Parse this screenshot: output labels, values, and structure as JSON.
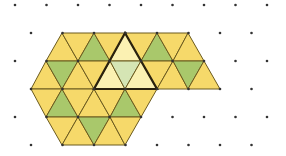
{
  "diagram": {
    "colors": {
      "yellow": "#F6D96A",
      "green": "#A9C86B",
      "pale_yellow": "#FBF1B2",
      "pale_green": "#D5E5B4",
      "edge": "#6B5A1E",
      "highlight_edge": "#2A220E",
      "dot": "#333333"
    },
    "grid": {
      "spacing_x": 31.5,
      "rows_y": [
        5,
        33,
        61,
        89,
        117,
        145
      ],
      "even_row_x0": 15,
      "odd_row_x0": 31,
      "even_row_count": 9,
      "odd_row_count": 8
    },
    "bands": [
      {
        "y_top": 33,
        "y_bottom": 61,
        "triangles": [
          {
            "pts": [
              [
                62,
                33
              ],
              [
                46,
                61
              ],
              [
                78,
                61
              ]
            ],
            "fill": "yellow"
          },
          {
            "pts": [
              [
                62,
                33
              ],
              [
                94,
                33
              ],
              [
                78,
                61
              ]
            ],
            "fill": "yellow"
          },
          {
            "pts": [
              [
                94,
                33
              ],
              [
                78,
                61
              ],
              [
                110,
                61
              ]
            ],
            "fill": "green"
          },
          {
            "pts": [
              [
                94,
                33
              ],
              [
                125,
                33
              ],
              [
                110,
                61
              ]
            ],
            "fill": "yellow"
          },
          {
            "pts": [
              [
                125,
                33
              ],
              [
                110,
                61
              ],
              [
                141,
                61
              ]
            ],
            "fill": "pale_yellow"
          },
          {
            "pts": [
              [
                125,
                33
              ],
              [
                157,
                33
              ],
              [
                141,
                61
              ]
            ],
            "fill": "yellow"
          },
          {
            "pts": [
              [
                157,
                33
              ],
              [
                141,
                61
              ],
              [
                173,
                61
              ]
            ],
            "fill": "green"
          },
          {
            "pts": [
              [
                157,
                33
              ],
              [
                188,
                33
              ],
              [
                173,
                61
              ]
            ],
            "fill": "yellow"
          },
          {
            "pts": [
              [
                188,
                33
              ],
              [
                173,
                61
              ],
              [
                204,
                61
              ]
            ],
            "fill": "yellow"
          }
        ]
      },
      {
        "y_top": 61,
        "y_bottom": 89,
        "triangles": [
          {
            "pts": [
              [
                46,
                61
              ],
              [
                31,
                89
              ],
              [
                62,
                89
              ]
            ],
            "fill": "yellow"
          },
          {
            "pts": [
              [
                46,
                61
              ],
              [
                78,
                61
              ],
              [
                62,
                89
              ]
            ],
            "fill": "green"
          },
          {
            "pts": [
              [
                78,
                61
              ],
              [
                62,
                89
              ],
              [
                94,
                89
              ]
            ],
            "fill": "yellow"
          },
          {
            "pts": [
              [
                78,
                61
              ],
              [
                110,
                61
              ],
              [
                94,
                89
              ]
            ],
            "fill": "yellow"
          },
          {
            "pts": [
              [
                110,
                61
              ],
              [
                94,
                89
              ],
              [
                125,
                89
              ]
            ],
            "fill": "pale_yellow"
          },
          {
            "pts": [
              [
                110,
                61
              ],
              [
                141,
                61
              ],
              [
                125,
                89
              ]
            ],
            "fill": "pale_green"
          },
          {
            "pts": [
              [
                141,
                61
              ],
              [
                125,
                89
              ],
              [
                157,
                89
              ]
            ],
            "fill": "pale_yellow"
          },
          {
            "pts": [
              [
                141,
                61
              ],
              [
                173,
                61
              ],
              [
                157,
                89
              ]
            ],
            "fill": "yellow"
          },
          {
            "pts": [
              [
                173,
                61
              ],
              [
                157,
                89
              ],
              [
                188,
                89
              ]
            ],
            "fill": "yellow"
          },
          {
            "pts": [
              [
                173,
                61
              ],
              [
                204,
                61
              ],
              [
                188,
                89
              ]
            ],
            "fill": "green"
          },
          {
            "pts": [
              [
                204,
                61
              ],
              [
                188,
                89
              ],
              [
                220,
                89
              ]
            ],
            "fill": "yellow"
          }
        ]
      },
      {
        "y_top": 89,
        "y_bottom": 117,
        "triangles": [
          {
            "pts": [
              [
                31,
                89
              ],
              [
                62,
                89
              ],
              [
                46,
                117
              ]
            ],
            "fill": "yellow"
          },
          {
            "pts": [
              [
                62,
                89
              ],
              [
                46,
                117
              ],
              [
                78,
                117
              ]
            ],
            "fill": "green"
          },
          {
            "pts": [
              [
                62,
                89
              ],
              [
                94,
                89
              ],
              [
                78,
                117
              ]
            ],
            "fill": "yellow"
          },
          {
            "pts": [
              [
                94,
                89
              ],
              [
                78,
                117
              ],
              [
                110,
                117
              ]
            ],
            "fill": "yellow"
          },
          {
            "pts": [
              [
                94,
                89
              ],
              [
                125,
                89
              ],
              [
                110,
                117
              ]
            ],
            "fill": "yellow"
          },
          {
            "pts": [
              [
                125,
                89
              ],
              [
                110,
                117
              ],
              [
                141,
                117
              ]
            ],
            "fill": "green"
          },
          {
            "pts": [
              [
                125,
                89
              ],
              [
                157,
                89
              ],
              [
                141,
                117
              ]
            ],
            "fill": "yellow"
          }
        ]
      },
      {
        "y_top": 117,
        "y_bottom": 145,
        "triangles": [
          {
            "pts": [
              [
                46,
                117
              ],
              [
                78,
                117
              ],
              [
                62,
                145
              ]
            ],
            "fill": "yellow"
          },
          {
            "pts": [
              [
                78,
                117
              ],
              [
                62,
                145
              ],
              [
                94,
                145
              ]
            ],
            "fill": "yellow"
          },
          {
            "pts": [
              [
                78,
                117
              ],
              [
                110,
                117
              ],
              [
                94,
                145
              ]
            ],
            "fill": "green"
          },
          {
            "pts": [
              [
                110,
                117
              ],
              [
                94,
                145
              ],
              [
                125,
                145
              ]
            ],
            "fill": "yellow"
          },
          {
            "pts": [
              [
                110,
                117
              ],
              [
                141,
                117
              ],
              [
                125,
                145
              ]
            ],
            "fill": "yellow"
          }
        ]
      }
    ],
    "highlight_triangle": {
      "pts": [
        [
          125,
          33
        ],
        [
          94,
          89
        ],
        [
          157,
          89
        ]
      ]
    }
  }
}
